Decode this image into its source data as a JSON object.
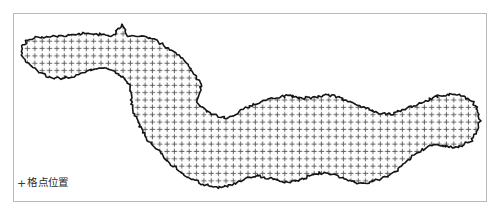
{
  "figure": {
    "background_color": "#ffffff",
    "frame_color": "#b9b9bc"
  },
  "map": {
    "name": "grid-point-distribution-map",
    "outline_color": "#151515",
    "outline_width": 1.6,
    "fill_color": "#ffffff"
  },
  "grid": {
    "marker_glyph": "+",
    "marker_color": "#5a5a5a",
    "marker_size": 5.2,
    "spacing_x": 7.35,
    "spacing_y": 7.35,
    "origin_x": 3.0,
    "origin_y": 2.0,
    "columns": 64,
    "rows": 26
  },
  "legend": {
    "marker": "+",
    "label": "格点位置",
    "marker_color": "#3a3a3a",
    "label_color": "#2b2b2b"
  },
  "chart_data": {
    "type": "scatter",
    "title": "",
    "xlabel": "",
    "ylabel": "",
    "legend_position": "bottom-left",
    "grid": false,
    "series": [
      {
        "name": "格点位置",
        "marker": "+",
        "color": "#5a5a5a",
        "description": "Regular lattice of grid points covering the study region"
      },
      {
        "name": "区域边界",
        "marker": "line",
        "color": "#151515",
        "description": "Administrative boundary outline of the study region"
      }
    ]
  }
}
